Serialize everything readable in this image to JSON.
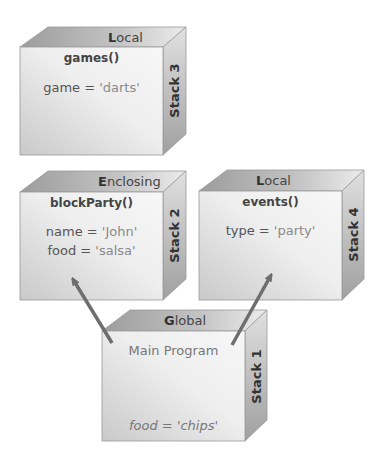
{
  "diagram": {
    "boxes": [
      {
        "id": "stack3",
        "scope_first": "L",
        "scope_rest": "ocal",
        "function": "games()",
        "side_label": "Stack 3",
        "vars": [
          {
            "name": "game",
            "eq": " = ",
            "value": "'darts'"
          }
        ]
      },
      {
        "id": "stack2",
        "scope_first": "E",
        "scope_rest": "nclosing",
        "function": "blockParty()",
        "side_label": "Stack 2",
        "vars": [
          {
            "name": "name",
            "eq": " = ",
            "value": "'John'"
          },
          {
            "name": "food",
            "eq": " = ",
            "value": "'salsa'"
          }
        ]
      },
      {
        "id": "stack4",
        "scope_first": "L",
        "scope_rest": "ocal",
        "function": "events()",
        "side_label": "Stack 4",
        "vars": [
          {
            "name": "type",
            "eq": " = ",
            "value": "'party'"
          }
        ]
      },
      {
        "id": "stack1",
        "scope_first": "G",
        "scope_rest": "lobal",
        "function": "Main Program",
        "side_label": "Stack 1",
        "vars": [
          {
            "name": "food",
            "eq": " = ",
            "value": "'chips'"
          }
        ]
      }
    ],
    "arrows": [
      {
        "from": "Global",
        "to": "Enclosing"
      },
      {
        "from": "Global",
        "to": "Local (events)"
      }
    ],
    "colors": {
      "front_light": "#f4f4f4",
      "front_dark": "#c8c8c8",
      "top_face": "#b0b0b0",
      "side_face": "#a8a8a8",
      "arrow": "#6e6e6e",
      "edge": "#9a9a9a"
    }
  }
}
